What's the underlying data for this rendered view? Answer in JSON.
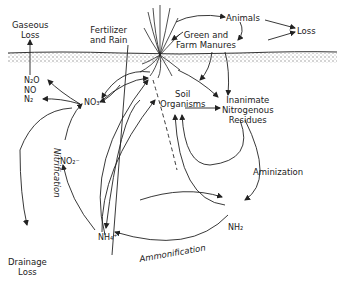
{
  "diagram": {
    "nodes": {
      "gaseous_loss": {
        "line1": "Gaseous",
        "line2": "Loss"
      },
      "fertilizer_rain": {
        "line1": "Fertilizer",
        "line2": "and Rain"
      },
      "animals": "Animals",
      "loss": "Loss",
      "manures": {
        "line1": "Green and",
        "line2": "Farm Manures"
      },
      "gases": {
        "n2o": "N₂O",
        "no": "NO",
        "n2": "N₂"
      },
      "nitrate": "NO₃⁻",
      "nitrite": "NO₂⁻",
      "soil_organisms": {
        "line1": "Soil",
        "line2": "Organisms"
      },
      "residues": {
        "line1": "Inanimate",
        "line2": "Nitrogenous",
        "line3": "Residues"
      },
      "ammonium": "NH₄⁺",
      "amine": "NH₂",
      "drainage_loss": {
        "line1": "Drainage",
        "line2": "Loss"
      }
    },
    "process_labels": {
      "nitrification": "Nitrification",
      "aminization": "Aminization",
      "ammonification": "Ammonification"
    },
    "colors": {
      "ink": "#222222",
      "soil": "#9a9a9a",
      "background": "#ffffff"
    }
  }
}
